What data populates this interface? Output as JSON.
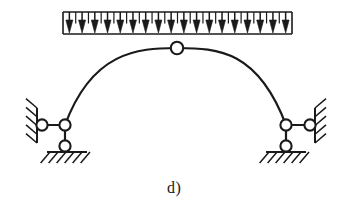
{
  "figure": {
    "label": "d)",
    "label_x": 167,
    "label_y": 179,
    "kind": "three-hinged-arch-with-uniform-distributed-load",
    "stroke_color": "#1a1a1a",
    "fill_color": "#1a1a1a",
    "background_color": "#ffffff",
    "width": 351,
    "height": 213
  },
  "load": {
    "name": "uniformly-distributed-load",
    "direction": "down",
    "x_start": 63,
    "x_end": 292,
    "y_top": 12,
    "y_bottom": 34,
    "arrow_count": 18,
    "arrow_head_width": 7,
    "arrow_head_height": 13,
    "line_width": 1.6
  },
  "arch": {
    "name": "three-hinged-arch-rib",
    "left_springing": {
      "x": 65,
      "y": 125
    },
    "crown": {
      "x": 177,
      "y": 48
    },
    "right_springing": {
      "x": 286,
      "y": 125
    },
    "left_control": {
      "x": 92,
      "y": 52
    },
    "right_control": {
      "x": 258,
      "y": 51
    },
    "stroke_width": 2.2
  },
  "hinges": [
    {
      "name": "crown-hinge",
      "x": 177,
      "y": 48,
      "r": 6.2
    },
    {
      "name": "left-arch-joint",
      "x": 65,
      "y": 125,
      "r": 5.6
    },
    {
      "name": "left-wall-pin",
      "x": 42,
      "y": 125,
      "r": 5.6
    },
    {
      "name": "left-ground-pin",
      "x": 65,
      "y": 146,
      "r": 5.6
    },
    {
      "name": "right-arch-joint",
      "x": 286,
      "y": 125,
      "r": 5.6
    },
    {
      "name": "right-wall-pin",
      "x": 310,
      "y": 125,
      "r": 5.6
    },
    {
      "name": "right-ground-pin",
      "x": 286,
      "y": 146,
      "r": 5.6
    }
  ],
  "links": [
    {
      "name": "left-horizontal-link",
      "x1": 42,
      "y1": 125,
      "x2": 65,
      "y2": 125
    },
    {
      "name": "left-vertical-link",
      "x1": 65,
      "y1": 125,
      "x2": 65,
      "y2": 146
    },
    {
      "name": "right-horizontal-link",
      "x1": 286,
      "y1": 125,
      "x2": 310,
      "y2": 125
    },
    {
      "name": "right-vertical-link",
      "x1": 286,
      "y1": 125,
      "x2": 286,
      "y2": 146
    }
  ],
  "supports": {
    "left_wall": {
      "name": "left-wall-support",
      "line_x": 37,
      "line_y1": 108,
      "line_y2": 143,
      "hatch_side": "left",
      "hatch_count": 5,
      "hatch_len": 11
    },
    "left_ground": {
      "name": "left-ground-support",
      "line_y": 152,
      "line_x1": 47,
      "line_x2": 87,
      "hatch_side": "below",
      "hatch_count": 6,
      "hatch_len": 11
    },
    "right_wall": {
      "name": "right-wall-support",
      "line_x": 315,
      "line_y1": 108,
      "line_y2": 143,
      "hatch_side": "right",
      "hatch_count": 5,
      "hatch_len": 11
    },
    "right_ground": {
      "name": "right-ground-support",
      "line_y": 152,
      "line_x1": 266,
      "line_x2": 306,
      "hatch_side": "below",
      "hatch_count": 6,
      "hatch_len": 11
    }
  }
}
